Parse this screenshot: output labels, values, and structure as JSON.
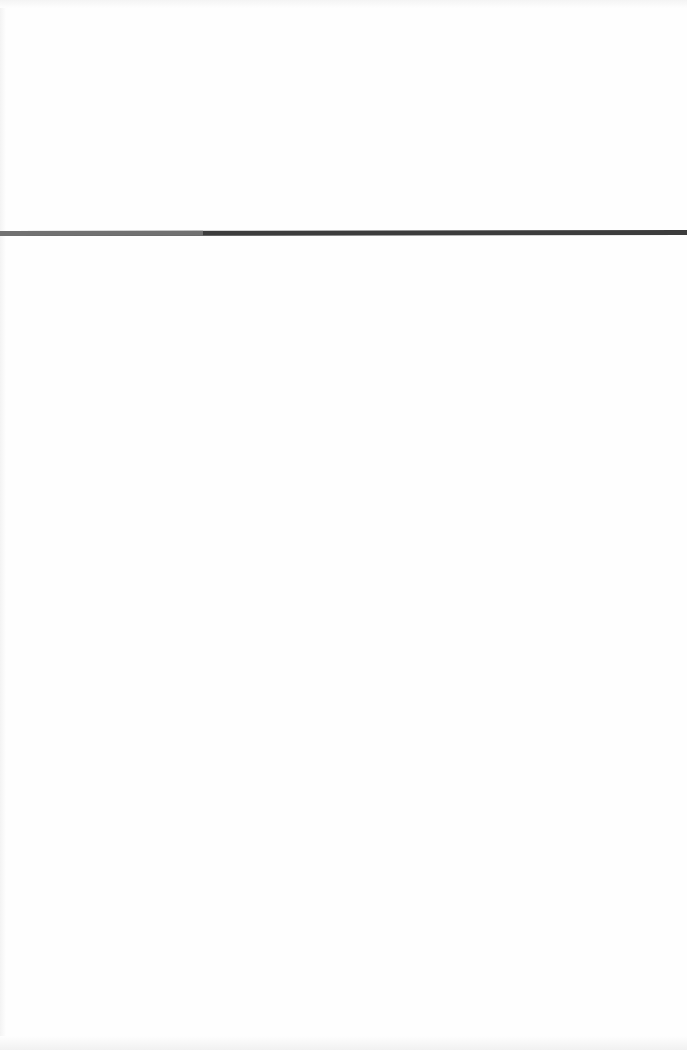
{
  "page": {
    "background": "#fefefe"
  },
  "progress_bar": {
    "fill_percent": 29.6,
    "fill_color": "#717171",
    "track_color": "#3c3c3c",
    "top_px": 231,
    "thickness_px": 5
  }
}
